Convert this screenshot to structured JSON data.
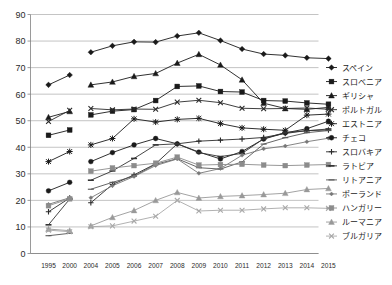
{
  "chart_data": {
    "type": "line",
    "title": "",
    "subtitle": "",
    "xlabel": "",
    "ylabel": "",
    "xlim": [
      0,
      13
    ],
    "ylim": [
      0,
      90
    ],
    "ytick_step": 10,
    "grid": true,
    "legend_position": "right",
    "categories": [
      "1995",
      "2000",
      "2004",
      "2005",
      "2006",
      "2007",
      "2008",
      "2009",
      "2010",
      "2011",
      "2012",
      "2013",
      "2014",
      "2015"
    ],
    "yticks": [
      "0",
      "10",
      "20",
      "30",
      "40",
      "50",
      "60",
      "70",
      "80",
      "90"
    ],
    "series": [
      {
        "name": "スペイン",
        "marker": "diamond",
        "color": "#1a1a1a",
        "values": [
          63.5,
          67.2,
          75.8,
          78.2,
          79.7,
          79.6,
          81.9,
          83.1,
          80.2,
          77.0,
          75.1,
          74.6,
          73.7,
          73.4
        ]
      },
      {
        "name": "スロベニア",
        "marker": "square",
        "color": "#1a1a1a",
        "values": [
          44.5,
          46.5,
          52.2,
          53.6,
          54.2,
          57.6,
          62.9,
          63.1,
          61.0,
          60.8,
          57.6,
          57.4,
          56.7,
          56.2
        ]
      },
      {
        "name": "ギリシャ",
        "marker": "triangle",
        "color": "#1a1a1a",
        "values": [
          51.3,
          53.5,
          63.5,
          64.6,
          66.7,
          67.8,
          71.7,
          75.0,
          71.0,
          65.4,
          56.6,
          54.6,
          54.3,
          55.0
        ]
      },
      {
        "name": "ポルトガル",
        "marker": "cross",
        "color": "#2a2a2a",
        "values": [
          49.7,
          53.9,
          54.6,
          54.1,
          54.4,
          54.3,
          57.0,
          57.7,
          56.8,
          54.7,
          54.5,
          54.6,
          54.8,
          54.3
        ]
      },
      {
        "name": "エストニア",
        "marker": "star",
        "color": "#1a1a1a",
        "values": [
          34.6,
          38.4,
          40.9,
          43.3,
          50.7,
          49.5,
          50.5,
          50.9,
          48.9,
          47.3,
          46.8,
          46.4,
          52.1,
          52.5
        ]
      },
      {
        "name": "チェコ",
        "marker": "circle",
        "color": "#1a1a1a",
        "values": [
          23.6,
          26.8,
          34.6,
          38.0,
          40.9,
          43.3,
          41.3,
          38.2,
          35.6,
          38.4,
          43.1,
          45.4,
          47.0,
          49.8
        ]
      },
      {
        "name": "スロバキア",
        "marker": "plus",
        "color": "#2a2a2a",
        "values": [
          15.7,
          20.9,
          19.1,
          26.0,
          29.6,
          33.8,
          41.3,
          42.3,
          42.7,
          43.1,
          43.7,
          45.2,
          46.3,
          46.5
        ]
      },
      {
        "name": "ラトビア",
        "marker": "dash",
        "color": "#333333",
        "values": [
          10.8,
          20.5,
          27.6,
          31.1,
          35.8,
          40.9,
          41.3,
          38.0,
          36.5,
          37.7,
          43.2,
          45.6,
          46.2,
          46.9
        ]
      },
      {
        "name": "リトアニア",
        "marker": "line",
        "color": "#555555",
        "values": [
          6.7,
          7.6,
          24.2,
          26.8,
          29.1,
          33.6,
          35.7,
          32.3,
          31.8,
          34.5,
          41.2,
          43.6,
          45.5,
          46.3
        ]
      },
      {
        "name": "ポーランド",
        "marker": "smalldiamond",
        "color": "#777777",
        "values": [
          18.5,
          21.0,
          21.0,
          25.5,
          29.0,
          33.1,
          35.6,
          30.2,
          32.0,
          37.0,
          39.4,
          40.5,
          42.1,
          43.4
        ]
      },
      {
        "name": "ハンガリー",
        "marker": "graysquare",
        "color": "#8c8c8c",
        "values": [
          18.0,
          20.6,
          31.0,
          32.2,
          33.1,
          34.0,
          36.3,
          33.3,
          33.5,
          33.6,
          33.3,
          33.1,
          33.3,
          33.5
        ]
      },
      {
        "name": "ルーマニア",
        "marker": "graytriangle",
        "color": "#999999",
        "values": [
          9.2,
          8.6,
          10.4,
          13.6,
          16.2,
          20.0,
          23.0,
          20.9,
          21.5,
          21.8,
          22.2,
          22.7,
          24.1,
          24.5
        ]
      },
      {
        "name": "ブルガリア",
        "marker": "graycross",
        "color": "#a8a8a8",
        "values": [
          8.8,
          8.2,
          10.1,
          10.4,
          12.2,
          14.0,
          20.0,
          16.0,
          16.3,
          16.3,
          16.8,
          17.2,
          17.2,
          17.0
        ]
      }
    ]
  },
  "legend": {
    "items": [
      {
        "label": "スペイン"
      },
      {
        "label": "スロベニア"
      },
      {
        "label": "ギリシャ"
      },
      {
        "label": "ポルトガル"
      },
      {
        "label": "エストニア"
      },
      {
        "label": "チェコ"
      },
      {
        "label": "スロバキア"
      },
      {
        "label": "ラトビア"
      },
      {
        "label": "リトアニア"
      },
      {
        "label": "ポーランド"
      },
      {
        "label": "ハンガリー"
      },
      {
        "label": "ルーマニア"
      },
      {
        "label": "ブルガリア"
      }
    ]
  }
}
